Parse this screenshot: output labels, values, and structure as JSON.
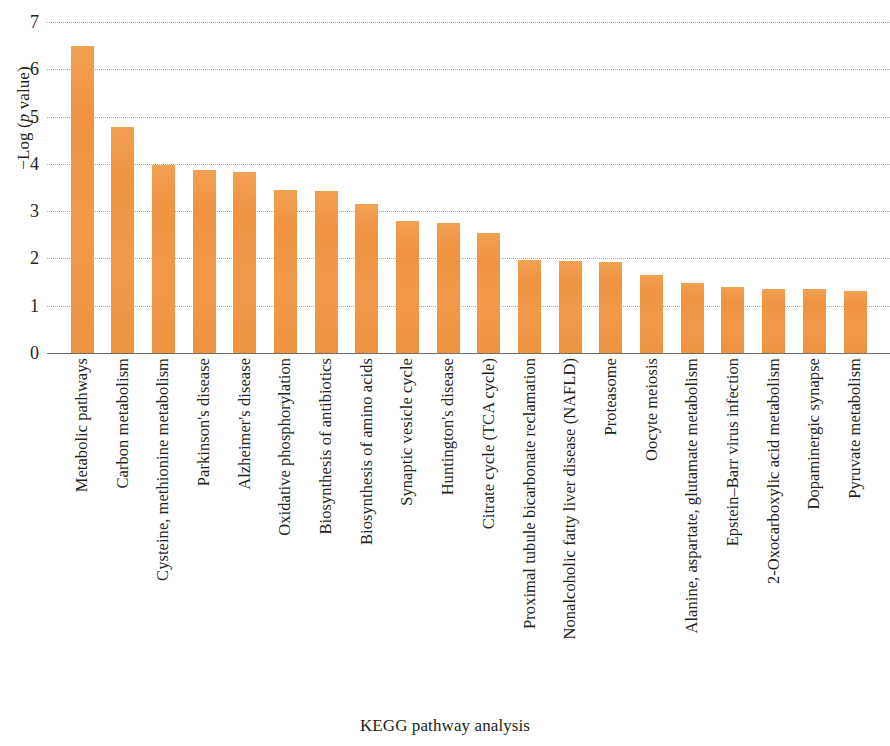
{
  "chart_data": {
    "type": "bar",
    "title": "",
    "xlabel": "KEGG pathway analysis",
    "ylabel": "−Log (p value)",
    "ylabel_parts": {
      "prefix": "−Log (",
      "italic": "p",
      "suffix": " value)"
    },
    "ylim": [
      0,
      7
    ],
    "yticks": [
      0,
      1,
      2,
      3,
      4,
      5,
      6,
      7
    ],
    "ytick_labels": [
      "0",
      "1",
      "2",
      "3",
      "4",
      "5",
      "6",
      "7"
    ],
    "grid": true,
    "grid_style": "dotted",
    "legend": "none",
    "bar_color": "#F0943F",
    "axis_color": "#6D6E71",
    "grid_color": "#9A9A9A",
    "orientation": "vertical",
    "categories": [
      "Metabolic pathways",
      "Carbon metabolism",
      "Cysteine, methionine metabolism",
      "Parkinson's disease",
      "Alzheimer's disease",
      "Oxidative phosphorylation",
      "Biosynthesis of antibiotics",
      "Biosynthesis of amino acids",
      "Synaptic vesicle cycle",
      "Huntington's disease",
      "Citrate cycle (TCA cycle)",
      "Proximal tubule bicarbonate reclamation",
      "Nonalcoholic fatty liver disease (NAFLD)",
      "Proteasome",
      "Oocyte meiosis",
      "Alanine, aspartate, glutamate metabolism",
      "Epstein–Barr virus infection",
      "2-Oxocarboxylic acid metabolism",
      "Dopaminergic synapse",
      "Pyruvate metabolism"
    ],
    "values": [
      6.5,
      4.78,
      3.97,
      3.86,
      3.82,
      3.44,
      3.43,
      3.15,
      2.79,
      2.76,
      2.53,
      1.96,
      1.94,
      1.92,
      1.65,
      1.49,
      1.4,
      1.35,
      1.35,
      1.32
    ]
  }
}
